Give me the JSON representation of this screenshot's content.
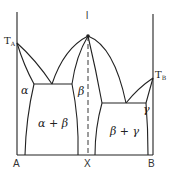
{
  "diagram": {
    "type": "binary phase diagram with intermediate phase",
    "colors": {
      "line": "#222222",
      "background": "#ffffff"
    },
    "labels": {
      "liquid": "l",
      "ta_main": "T",
      "ta_sub": "A",
      "tb_main": "T",
      "tb_sub": "B",
      "alpha": "α",
      "beta": "β",
      "gamma": "γ",
      "alpha_beta": "α + β",
      "beta_gamma": "β + γ"
    },
    "axis": {
      "left_label": "A",
      "middle_label": "X",
      "right_label": "B"
    }
  }
}
